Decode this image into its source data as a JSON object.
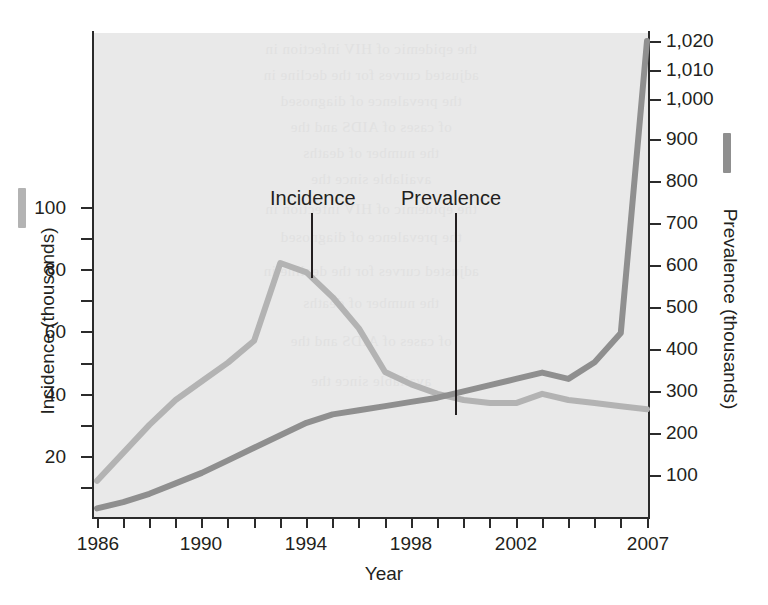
{
  "chart_data": {
    "type": "line",
    "title": "",
    "subtitle": "",
    "xlabel": "Year",
    "ylabel": "Incidence (thousands)",
    "ylabel_right": "Prevalence (thousands)",
    "grid": false,
    "legend_position": "inline-annotations",
    "xlim": [
      1986,
      2007
    ],
    "x_ticks_labeled": [
      "1986",
      "1990",
      "1994",
      "1998",
      "2002",
      "2007"
    ],
    "x_ticks_all": [
      1986,
      1987,
      1988,
      1989,
      1990,
      1991,
      1992,
      1993,
      1994,
      1995,
      1996,
      1997,
      1998,
      1999,
      2000,
      2001,
      2002,
      2003,
      2004,
      2005,
      2006,
      2007
    ],
    "ylim_left": [
      0,
      110
    ],
    "y_ticks_left": [
      20,
      40,
      60,
      80,
      100
    ],
    "y_ticks_left_minor": [
      10,
      30,
      50,
      70,
      90,
      110
    ],
    "ylim_right": [
      0,
      1020
    ],
    "y_ticks_right": [
      100,
      200,
      300,
      400,
      500,
      600,
      700,
      800,
      900,
      "1,000",
      "1,010",
      "1,020"
    ],
    "right_axis_note": "broken scale: compressed above 1,000",
    "series": [
      {
        "name": "Incidence",
        "axis": "left",
        "units": "thousands",
        "color": "#b3b3b3",
        "x": [
          1986,
          1987,
          1988,
          1989,
          1990,
          1991,
          1992,
          1993,
          1994,
          1995,
          1996,
          1997,
          1998,
          1999,
          2000,
          2001,
          2002,
          2003,
          2004,
          2005,
          2006,
          2007
        ],
        "values": [
          12,
          21,
          30,
          38,
          44,
          50,
          57,
          82,
          79,
          71,
          61,
          47,
          43,
          40,
          38,
          37,
          37,
          40,
          38,
          37,
          36,
          35
        ]
      },
      {
        "name": "Prevalence",
        "axis": "right",
        "units": "thousands",
        "color": "#8f8f8f",
        "x": [
          1986,
          1987,
          1988,
          1989,
          1990,
          1991,
          1992,
          1993,
          1994,
          1995,
          1996,
          1997,
          1998,
          1999,
          2000,
          2001,
          2002,
          2003,
          2004,
          2005,
          2006,
          2007
        ],
        "values": [
          20,
          35,
          55,
          80,
          105,
          135,
          165,
          195,
          225,
          245,
          255,
          265,
          275,
          285,
          300,
          315,
          330,
          345,
          330,
          370,
          440,
          1020
        ]
      }
    ],
    "annotations": [
      {
        "text": "Incidence",
        "points_to_series": "Incidence",
        "points_to_x": 1994
      },
      {
        "text": "Prevalence",
        "points_to_series": "Prevalence",
        "points_to_x": 2000
      }
    ]
  },
  "axes": {
    "x_title": "Year",
    "left_title": "Incidence (thousands)",
    "right_title": "Prevalence (thousands)",
    "left_tick_labels": [
      "100",
      "80",
      "60",
      "40",
      "20"
    ],
    "right_tick_labels": [
      "1,020",
      "1,010",
      "1,000",
      "900",
      "800",
      "700",
      "600",
      "500",
      "400",
      "300",
      "200",
      "100"
    ],
    "x_tick_labels": [
      "1986",
      "1990",
      "1994",
      "1998",
      "2002",
      "2007"
    ]
  },
  "annotations": {
    "incidence_label": "Incidence",
    "prevalence_label": "Prevalence"
  },
  "colors": {
    "incidence": "#b3b3b3",
    "prevalence": "#8f8f8f",
    "axis": "#2b2b2b",
    "plot_background": "#e9e9e9",
    "page_background": "#ffffff",
    "text": "#231f20"
  },
  "show_through_text": [
    "the epidemic of HIV infection in",
    "adjusted curves for the decline in",
    "the prevalence of diagnosed",
    "of cases of AIDS and the",
    "the number of deaths",
    "available since the"
  ]
}
